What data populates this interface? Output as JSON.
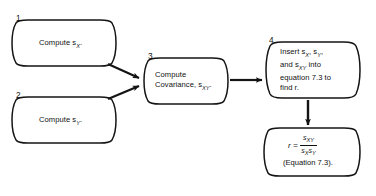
{
  "diagram": {
    "stroke_color": "#141414",
    "background_color": "#ffffff",
    "nodes": [
      {
        "id": "node-1",
        "number": "1.",
        "shape": "curved-sided-box",
        "lines": [
          {
            "text": "Compute s",
            "sub": "X",
            "tail": "."
          }
        ]
      },
      {
        "id": "node-2",
        "number": "2.",
        "shape": "curved-sided-box",
        "lines": [
          {
            "text": "Compute s",
            "sub": "Y",
            "tail": "."
          }
        ]
      },
      {
        "id": "node-3",
        "number": "3.",
        "shape": "curved-sided-box",
        "lines": [
          {
            "text": "Compute",
            "sub": "",
            "tail": ""
          },
          {
            "text": "Covariance, s",
            "sub": "XY",
            "tail": "."
          }
        ]
      },
      {
        "id": "node-4",
        "number": "4.",
        "shape": "curved-sided-box",
        "lines": [
          {
            "text": "Insert s",
            "sub": "X",
            "tail": ", s",
            "sub2": "Y",
            "tail2": ","
          },
          {
            "text": "and s",
            "sub": "XY",
            "tail": " into"
          },
          {
            "text": "equation 7.3 to",
            "sub": "",
            "tail": ""
          },
          {
            "text": "find r.",
            "sub": "",
            "tail": ""
          }
        ]
      },
      {
        "id": "node-5",
        "number": "",
        "shape": "curved-sided-box",
        "equation": {
          "lhs": "r",
          "equals": "=",
          "numerator": "s",
          "numerator_sub": "XY",
          "denominator_a": "s",
          "denominator_a_sub": "X",
          "denominator_b": "s",
          "denominator_b_sub": "Y"
        },
        "caption": "(Equation 7.3)."
      }
    ],
    "arrows": [
      {
        "id": "arrow-1-to-3",
        "from": "node-1",
        "to": "node-3",
        "direction": "down-right"
      },
      {
        "id": "arrow-2-to-3",
        "from": "node-2",
        "to": "node-3",
        "direction": "up-right"
      },
      {
        "id": "arrow-3-to-4",
        "from": "node-3",
        "to": "node-4",
        "direction": "right"
      },
      {
        "id": "arrow-4-to-5",
        "from": "node-4",
        "to": "node-5",
        "direction": "down"
      }
    ]
  }
}
